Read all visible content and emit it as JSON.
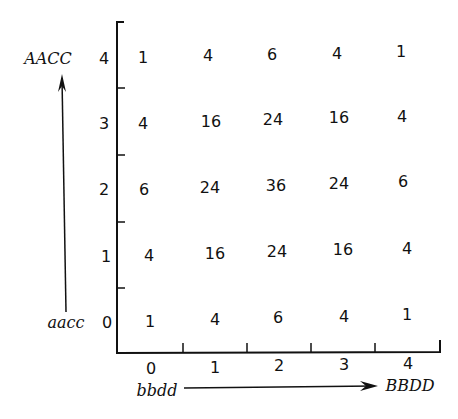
{
  "axes": {
    "y_top_label": "AACC",
    "y_bottom_label": "aacc",
    "x_left_label": "bbdd",
    "x_right_label": "BBDD",
    "row_labels": [
      "4",
      "3",
      "2",
      "1",
      "0"
    ],
    "col_labels": [
      "0",
      "1",
      "2",
      "3",
      "4"
    ]
  },
  "grid": {
    "rows": [
      [
        "1",
        "4",
        "6",
        "4",
        "1"
      ],
      [
        "4",
        "16",
        "24",
        "16",
        "4"
      ],
      [
        "6",
        "24",
        "36",
        "24",
        "6"
      ],
      [
        "4",
        "16",
        "24",
        "16",
        "4"
      ],
      [
        "1",
        "4",
        "6",
        "4",
        "1"
      ]
    ]
  }
}
